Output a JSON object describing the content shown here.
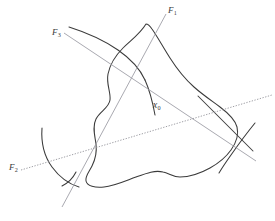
{
  "figure": {
    "type": "mathematical-diagram",
    "background_color": "#ffffff",
    "curve_color": "#3b3b3b",
    "line_color": "#8c8c8c",
    "label_color": "#3a3a3a",
    "labels": {
      "f1": {
        "base": "F",
        "sub": "1",
        "x": 168,
        "y": 6
      },
      "f3": {
        "base": "F",
        "sub": "3",
        "x": 52,
        "y": 28
      },
      "f2": {
        "base": "F",
        "sub": "2",
        "x": 9,
        "y": 163
      },
      "x0": {
        "base": "x",
        "sub": "0",
        "x": 153,
        "y": 101
      }
    },
    "lines": [
      {
        "name": "F1",
        "style": "solid-thin",
        "x1": 166,
        "y1": 14,
        "x2": 62,
        "y2": 207
      },
      {
        "name": "F3",
        "style": "solid-thin",
        "x1": 64,
        "y1": 33,
        "x2": 256,
        "y2": 161
      },
      {
        "name": "F2",
        "style": "dotted",
        "x1": 21,
        "y1": 170,
        "x2": 272,
        "y2": 95
      }
    ],
    "curves": [
      {
        "name": "region-boundary",
        "closed": true,
        "style": "solid"
      },
      {
        "name": "arc-upper-left",
        "closed": false,
        "style": "solid"
      },
      {
        "name": "arc-lower-left",
        "closed": false,
        "style": "solid"
      },
      {
        "name": "arc-right",
        "closed": false,
        "style": "solid"
      }
    ]
  }
}
